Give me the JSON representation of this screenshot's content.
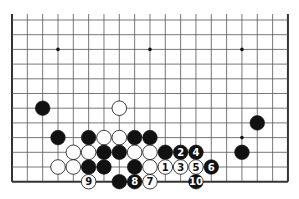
{
  "diagram": {
    "type": "go-board-fragment",
    "board": {
      "columns": 19,
      "visible_rows": 12,
      "top_edge_open": true,
      "origin_x": 12,
      "origin_y": 20,
      "spacing_x": 15.33,
      "spacing_y": 14.7,
      "line_color": "#555555",
      "edge_color": "#333333"
    },
    "star_points": [
      {
        "col": 3,
        "row": 2
      },
      {
        "col": 9,
        "row": 2
      },
      {
        "col": 15,
        "row": 2
      },
      {
        "col": 15,
        "row": 8
      }
    ],
    "stones": [
      {
        "col": 2,
        "row": 6,
        "color": "black"
      },
      {
        "col": 7,
        "row": 6,
        "color": "white"
      },
      {
        "col": 16,
        "row": 7,
        "color": "black"
      },
      {
        "col": 3,
        "row": 8,
        "color": "black"
      },
      {
        "col": 5,
        "row": 8,
        "color": "black"
      },
      {
        "col": 6,
        "row": 8,
        "color": "white"
      },
      {
        "col": 7,
        "row": 8,
        "color": "white"
      },
      {
        "col": 8,
        "row": 8,
        "color": "black"
      },
      {
        "col": 9,
        "row": 8,
        "color": "black"
      },
      {
        "col": 4,
        "row": 9,
        "color": "white"
      },
      {
        "col": 5,
        "row": 9,
        "color": "white"
      },
      {
        "col": 6,
        "row": 9,
        "color": "black"
      },
      {
        "col": 7,
        "row": 9,
        "color": "black"
      },
      {
        "col": 8,
        "row": 9,
        "color": "white"
      },
      {
        "col": 9,
        "row": 9,
        "color": "white"
      },
      {
        "col": 10,
        "row": 9,
        "color": "black"
      },
      {
        "col": 11,
        "row": 9,
        "color": "black",
        "label": "2"
      },
      {
        "col": 12,
        "row": 9,
        "color": "black",
        "label": "4"
      },
      {
        "col": 15,
        "row": 9,
        "color": "black"
      },
      {
        "col": 3,
        "row": 10,
        "color": "white"
      },
      {
        "col": 4,
        "row": 10,
        "color": "white"
      },
      {
        "col": 5,
        "row": 10,
        "color": "black"
      },
      {
        "col": 6,
        "row": 10,
        "color": "black"
      },
      {
        "col": 8,
        "row": 10,
        "color": "black"
      },
      {
        "col": 9,
        "row": 10,
        "color": "white"
      },
      {
        "col": 10,
        "row": 10,
        "color": "white",
        "label": "1"
      },
      {
        "col": 11,
        "row": 10,
        "color": "white",
        "label": "3"
      },
      {
        "col": 12,
        "row": 10,
        "color": "white",
        "label": "5"
      },
      {
        "col": 13,
        "row": 10,
        "color": "black",
        "label": "6"
      },
      {
        "col": 5,
        "row": 11,
        "color": "white",
        "label": "9"
      },
      {
        "col": 7,
        "row": 11,
        "color": "black"
      },
      {
        "col": 8,
        "row": 11,
        "color": "black",
        "label": "8"
      },
      {
        "col": 9,
        "row": 11,
        "color": "white",
        "label": "7"
      },
      {
        "col": 12,
        "row": 11,
        "color": "black",
        "label": "10"
      }
    ]
  }
}
